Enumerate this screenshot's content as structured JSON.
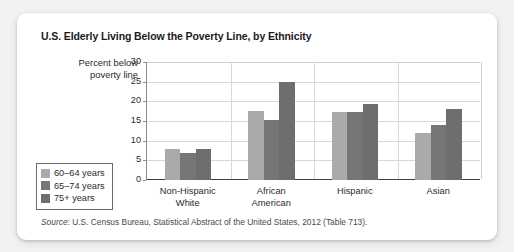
{
  "chart_data": {
    "type": "bar",
    "title": "U.S. Elderly Living Below the Poverty Line, by Ethnicity",
    "xlabel": "",
    "ylabel": "Percent below poverty line",
    "ylim": [
      0,
      30
    ],
    "yticks": [
      0,
      5,
      10,
      15,
      20,
      25,
      30
    ],
    "grid": true,
    "legend_position": "bottom-left",
    "categories": [
      "Non-Hispanic White",
      "African American",
      "Hispanic",
      "Asian"
    ],
    "category_lines": [
      [
        "Non-Hispanic",
        "White"
      ],
      [
        "African",
        "American"
      ],
      [
        "Hispanic"
      ],
      [
        "Asian"
      ]
    ],
    "series": [
      {
        "name": "60–64 years",
        "color": "#abaaaa",
        "values": [
          8.0,
          17.5,
          17.4,
          11.9
        ]
      },
      {
        "name": "65–74 years",
        "color": "#767676",
        "values": [
          6.8,
          15.2,
          17.4,
          13.9
        ]
      },
      {
        "name": "75+ years",
        "color": "#6e6e6e",
        "values": [
          8.0,
          24.8,
          19.4,
          18.0
        ]
      }
    ]
  },
  "source": {
    "label": "Source",
    "separator": ": ",
    "text": "U.S. Census Bureau, Statistical Abstract of the United States, 2012 (Table 713)."
  }
}
